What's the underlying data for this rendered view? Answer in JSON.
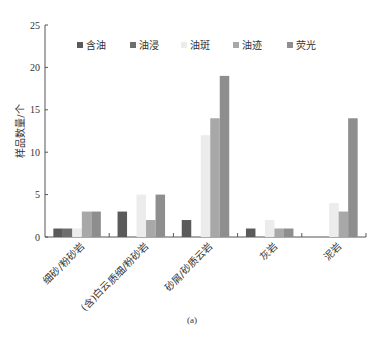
{
  "chart_data": {
    "type": "bar",
    "title": "",
    "caption": "(a)",
    "xlabel": "",
    "ylabel": "样品数量/个",
    "ylim": [
      0,
      25
    ],
    "yticks": [
      0,
      5,
      10,
      15,
      20,
      25
    ],
    "grid": false,
    "legend_position": "top-inside",
    "categories": [
      "细砂/粉砂岩",
      "(含)白云质细/粉砂岩",
      "砂屑/砂质云岩",
      "灰岩",
      "泥岩"
    ],
    "series": [
      {
        "name": "含油",
        "color": "#5a5a5a",
        "values": [
          1,
          3,
          2,
          1,
          0
        ]
      },
      {
        "name": "油浸",
        "color": "#6e6e6e",
        "values": [
          1,
          0,
          0,
          0,
          0
        ]
      },
      {
        "name": "油斑",
        "color": "#ececec",
        "values": [
          1,
          5,
          12,
          2,
          4
        ]
      },
      {
        "name": "油迹",
        "color": "#a8a8a8",
        "values": [
          3,
          2,
          14,
          1,
          3
        ]
      },
      {
        "name": "荧光",
        "color": "#8e8e8e",
        "values": [
          3,
          5,
          19,
          1,
          14
        ]
      }
    ]
  }
}
